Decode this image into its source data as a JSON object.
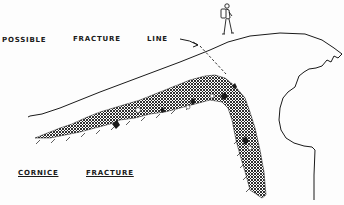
{
  "diagram": {
    "labels": {
      "word1": "POSSIBLE",
      "word2": "FRACTURE",
      "word3": "LINE",
      "title_word1": "CORNICE",
      "title_word2": "FRACTURE"
    },
    "elements": {
      "figure": "hiker-with-backpack",
      "snow_surface": "cornice-top-surface",
      "fracture_line": "dashed-possible-fracture-line",
      "snow_layer": "cross-hatched-weak-layer",
      "cornice_lip": "overhanging-cornice-lip",
      "arrow": "pointer-arrow"
    },
    "colors": {
      "ink": "#1a1a1a",
      "paper": "#fdfdfd"
    }
  }
}
